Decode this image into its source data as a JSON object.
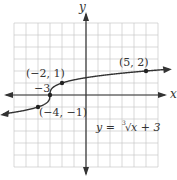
{
  "chart_data": {
    "type": "line",
    "title": "",
    "xlabel": "x",
    "ylabel": "y",
    "xlim": [
      -6,
      6
    ],
    "ylim": [
      -6,
      6
    ],
    "grid": true,
    "function_label": "y = ∛x + 3",
    "series": [
      {
        "name": "y = cbrt(x + 3)",
        "x": [
          -6.5,
          -4,
          -3,
          -2,
          0,
          5,
          6.5
        ],
        "y": [
          -1.52,
          -1,
          0,
          1,
          1.44,
          2,
          2.12
        ]
      }
    ],
    "points": [
      {
        "label": "(5, 2)",
        "x": 5,
        "y": 2
      },
      {
        "label": "(−2, 1)",
        "x": -2,
        "y": 1
      },
      {
        "label": "(−4, −1)",
        "x": -4,
        "y": -1
      },
      {
        "label": "−3",
        "x": -3,
        "y": 0
      }
    ],
    "annotations": [
      "(5, 2)",
      "(−2, 1)",
      "(−4, −1)",
      "−3",
      "y = ∛x + 3"
    ]
  },
  "labels": {
    "x_axis": "x",
    "y_axis": "y",
    "p1": "(5, 2)",
    "p2": "(−2, 1)",
    "p3": "(−4, −1)",
    "p4": "−3",
    "eq_y": "y = ",
    "eq_idx": "3",
    "eq_rest": "x + 3"
  }
}
